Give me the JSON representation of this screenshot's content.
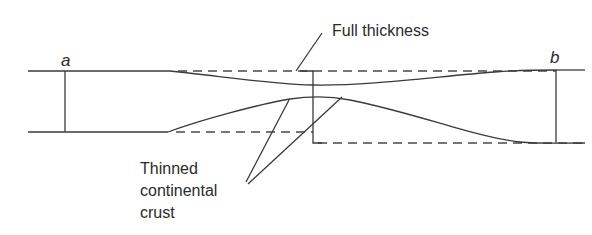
{
  "diagram": {
    "labels": {
      "point_a": "a",
      "point_b": "b",
      "full_thickness": "Full thickness",
      "thinned_line1": "Thinned",
      "thinned_line2": "continental",
      "thinned_line3": "crust"
    },
    "colors": {
      "line": "#3a3a3a",
      "text": "#2b2b2b",
      "background": "#ffffff"
    }
  }
}
